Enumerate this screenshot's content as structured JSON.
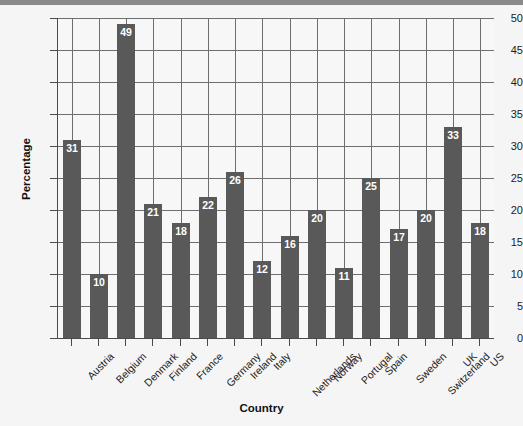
{
  "chart_data": {
    "type": "bar",
    "title": "",
    "xlabel": "Country",
    "ylabel": "Percentage",
    "categories": [
      "Austria",
      "Belgium",
      "Denmark",
      "Finland",
      "France",
      "Germany",
      "Ireland",
      "Italy",
      "Netherlands",
      "Norway",
      "Portugal",
      "Spain",
      "Sweden",
      "Switzerland",
      "UK",
      "US"
    ],
    "values": [
      31,
      10,
      49,
      21,
      18,
      22,
      26,
      12,
      16,
      20,
      11,
      25,
      17,
      20,
      33,
      18
    ],
    "ylim": [
      0,
      50
    ],
    "ytick_values": [
      0,
      5,
      10,
      15,
      20,
      25,
      30,
      35,
      40,
      45,
      50
    ],
    "ytick_labels": [
      "0",
      "5",
      "10",
      "15",
      "20",
      "25",
      "30",
      "35",
      "40",
      "45",
      "50"
    ],
    "grid": "both",
    "legend": "none",
    "bar_color": "#595959",
    "value_label_color": "#ffffff",
    "show_value_labels": true,
    "axis_color": "#4a4a4a",
    "grid_color": "#6e6e6e",
    "plot_background": "#f7f7f7",
    "figure_background": "#f5f5f5"
  }
}
